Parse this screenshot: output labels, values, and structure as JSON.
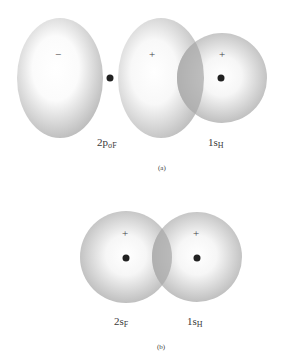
{
  "figure_a": {
    "caption": "(a)",
    "orbital_p": {
      "label_main": "2p",
      "label_sub": "σF",
      "lobe_left_sign": "−",
      "lobe_right_sign": "+"
    },
    "orbital_s": {
      "label_main": "1s",
      "label_sub": "H",
      "sign": "+"
    }
  },
  "figure_b": {
    "caption": "(b)",
    "orbital_f": {
      "label_main": "2s",
      "label_sub": "F",
      "sign": "+"
    },
    "orbital_h": {
      "label_main": "1s",
      "label_sub": "H",
      "sign": "+"
    }
  },
  "colors": {
    "orbital_edge": "#b8b8b8",
    "orbital_center": "#ffffff",
    "overlap": "#a8a8a8",
    "nucleus": "#222222"
  }
}
